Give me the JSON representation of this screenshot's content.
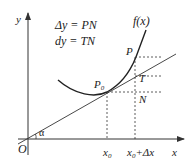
{
  "labels": {
    "delta_y_eq": "Δy = PN",
    "dy_eq": "dy = TN",
    "function": "f(x)",
    "y_axis": "y",
    "x_axis": "x",
    "origin": "O",
    "angle": "α",
    "point_p0": "P",
    "point_p0_sub": "0",
    "point_p": "P",
    "point_t": "T",
    "point_n": "N",
    "x0": "x",
    "x0_sub": "0",
    "x0_dx_a": "x",
    "x0_dx_sub": "0",
    "x0_dx_b": "+Δx"
  },
  "colors": {
    "stroke": "#333333",
    "text": "#222222"
  }
}
